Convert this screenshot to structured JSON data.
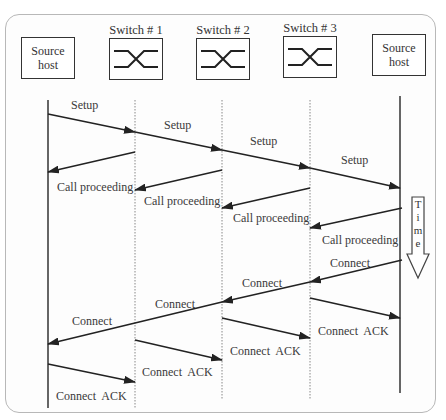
{
  "diagram": {
    "title": "",
    "nodes": [
      {
        "id": "source_left",
        "label": "Source\nhost",
        "type": "host",
        "x": 48
      },
      {
        "id": "switch1",
        "label": "Switch # 1",
        "type": "switch",
        "x": 135
      },
      {
        "id": "switch2",
        "label": "Switch # 2",
        "type": "switch",
        "x": 222
      },
      {
        "id": "switch3",
        "label": "Switch # 3",
        "type": "switch",
        "x": 310
      },
      {
        "id": "source_right",
        "label": "Source\nhost",
        "type": "host",
        "x": 400
      }
    ],
    "time_label": "Time",
    "time_letters": [
      "T",
      "i",
      "m",
      "e"
    ],
    "messages": [
      {
        "label": "Setup",
        "from": "source_left",
        "to": "switch1"
      },
      {
        "label": "Setup",
        "from": "switch1",
        "to": "switch2"
      },
      {
        "label": "Setup",
        "from": "switch2",
        "to": "switch3"
      },
      {
        "label": "Setup",
        "from": "switch3",
        "to": "source_right"
      },
      {
        "label": "Call proceeding",
        "from": "switch1",
        "to": "source_left"
      },
      {
        "label": "Call proceeding",
        "from": "switch2",
        "to": "switch1"
      },
      {
        "label": "Call proceeding",
        "from": "switch3",
        "to": "switch2"
      },
      {
        "label": "Call proceeding",
        "from": "source_right",
        "to": "switch3"
      },
      {
        "label": "Connect",
        "from": "source_right",
        "to": "switch3"
      },
      {
        "label": "Connect",
        "from": "switch3",
        "to": "switch2"
      },
      {
        "label": "Connect",
        "from": "switch2",
        "to": "source_left"
      },
      {
        "label": "Connect  ACK",
        "from": "switch3",
        "to": "source_right"
      },
      {
        "label": "Connect  ACK",
        "from": "switch2",
        "to": "switch3"
      },
      {
        "label": "Connect  ACK",
        "from": "switch1",
        "to": "switch2"
      },
      {
        "label": "Connect  ACK",
        "from": "source_left",
        "to": "switch1"
      }
    ]
  }
}
